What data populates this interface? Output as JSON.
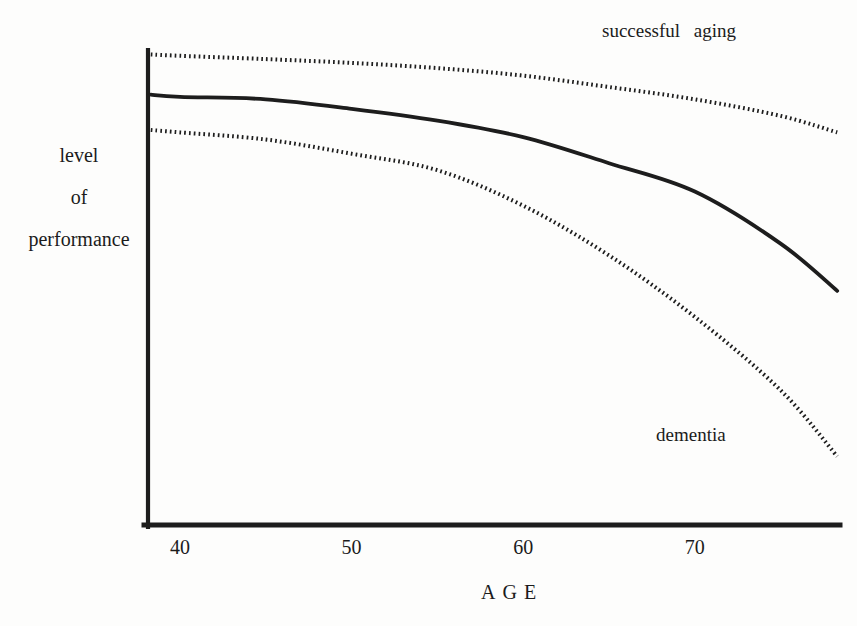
{
  "chart_data": {
    "type": "line",
    "title": "",
    "xlabel": "AGE",
    "ylabel": "level of performance",
    "ylabel_lines": [
      "level",
      "of",
      "performance"
    ],
    "x_ticks": [
      "40",
      "50",
      "60",
      "70"
    ],
    "xlim": [
      38.3,
      78.5
    ],
    "ylim": [
      0,
      100
    ],
    "y_axis_tick_labels": "none (qualitative axis)",
    "grid": false,
    "legend_position": "inline annotations",
    "line_color": "#1d1d1d",
    "background_color": "#fdfdfc",
    "x": [
      38.3,
      40,
      45,
      50,
      55,
      60,
      65,
      70,
      75,
      78.3
    ],
    "series": [
      {
        "name": "successful aging",
        "label": "successful aging",
        "style": "dotted",
        "values": [
          99.5,
          99.2,
          98.5,
          97.7,
          96.6,
          95,
          92.6,
          90,
          86.5,
          83
        ]
      },
      {
        "name": "normal aging",
        "label": "",
        "style": "solid",
        "values": [
          91,
          90.5,
          90,
          88,
          85.5,
          82,
          76.5,
          70.5,
          59.5,
          49.5
        ]
      },
      {
        "name": "dementia",
        "label": "dementia",
        "style": "dotted",
        "values": [
          83.5,
          83,
          81.5,
          78.5,
          75,
          67.5,
          57,
          44,
          28.5,
          14.5
        ]
      }
    ]
  }
}
